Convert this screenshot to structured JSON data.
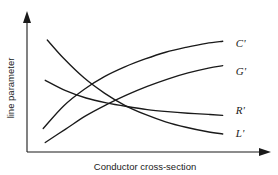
{
  "chart_data": {
    "type": "line",
    "title": "",
    "subtitle": "",
    "xlabel": "Conductor cross-section",
    "ylabel": "line parameter",
    "grid": false,
    "legend_position": "inline-right-of-curve-ends",
    "axes": {
      "x_ticks": [],
      "y_ticks": [],
      "x_arrow": true,
      "y_arrow": true,
      "xlim": [
        0,
        1
      ],
      "ylim": [
        0,
        1
      ],
      "note": "Qualitative schematic axes with arrowheads; no numeric tick labels are shown."
    },
    "annotations": [
      "Curves are qualitative trends versus conductor cross-section.",
      "C-prime and G-prime increase monotonically; R-prime and L-prime decrease monotonically."
    ],
    "series": [
      {
        "name": "C'",
        "label": "C'",
        "trend": "increasing",
        "label_x": 0.965,
        "label_y": 0.845,
        "x": [
          0.05,
          0.15,
          0.25,
          0.35,
          0.45,
          0.55,
          0.65,
          0.75,
          0.85,
          0.93
        ],
        "values": [
          0.16,
          0.345,
          0.48,
          0.585,
          0.665,
          0.73,
          0.785,
          0.825,
          0.858,
          0.875
        ]
      },
      {
        "name": "G'",
        "label": "G'",
        "trend": "increasing",
        "label_x": 0.965,
        "label_y": 0.62,
        "x": [
          0.06,
          0.16,
          0.26,
          0.36,
          0.46,
          0.56,
          0.66,
          0.76,
          0.86,
          0.93
        ],
        "values": [
          0.045,
          0.155,
          0.265,
          0.355,
          0.435,
          0.505,
          0.565,
          0.615,
          0.655,
          0.675
        ]
      },
      {
        "name": "R'",
        "label": "R'",
        "trend": "decreasing",
        "label_x": 0.965,
        "label_y": 0.3,
        "x": [
          0.06,
          0.16,
          0.26,
          0.36,
          0.46,
          0.56,
          0.66,
          0.76,
          0.86,
          0.93
        ],
        "values": [
          0.555,
          0.47,
          0.41,
          0.37,
          0.34,
          0.315,
          0.298,
          0.285,
          0.275,
          0.268
        ]
      },
      {
        "name": "L'",
        "label": "L'",
        "trend": "decreasing",
        "label_x": 0.965,
        "label_y": 0.115,
        "x": [
          0.07,
          0.15,
          0.25,
          0.35,
          0.45,
          0.55,
          0.65,
          0.75,
          0.85,
          0.93
        ],
        "values": [
          0.885,
          0.735,
          0.575,
          0.45,
          0.35,
          0.275,
          0.215,
          0.17,
          0.135,
          0.115
        ]
      }
    ]
  }
}
